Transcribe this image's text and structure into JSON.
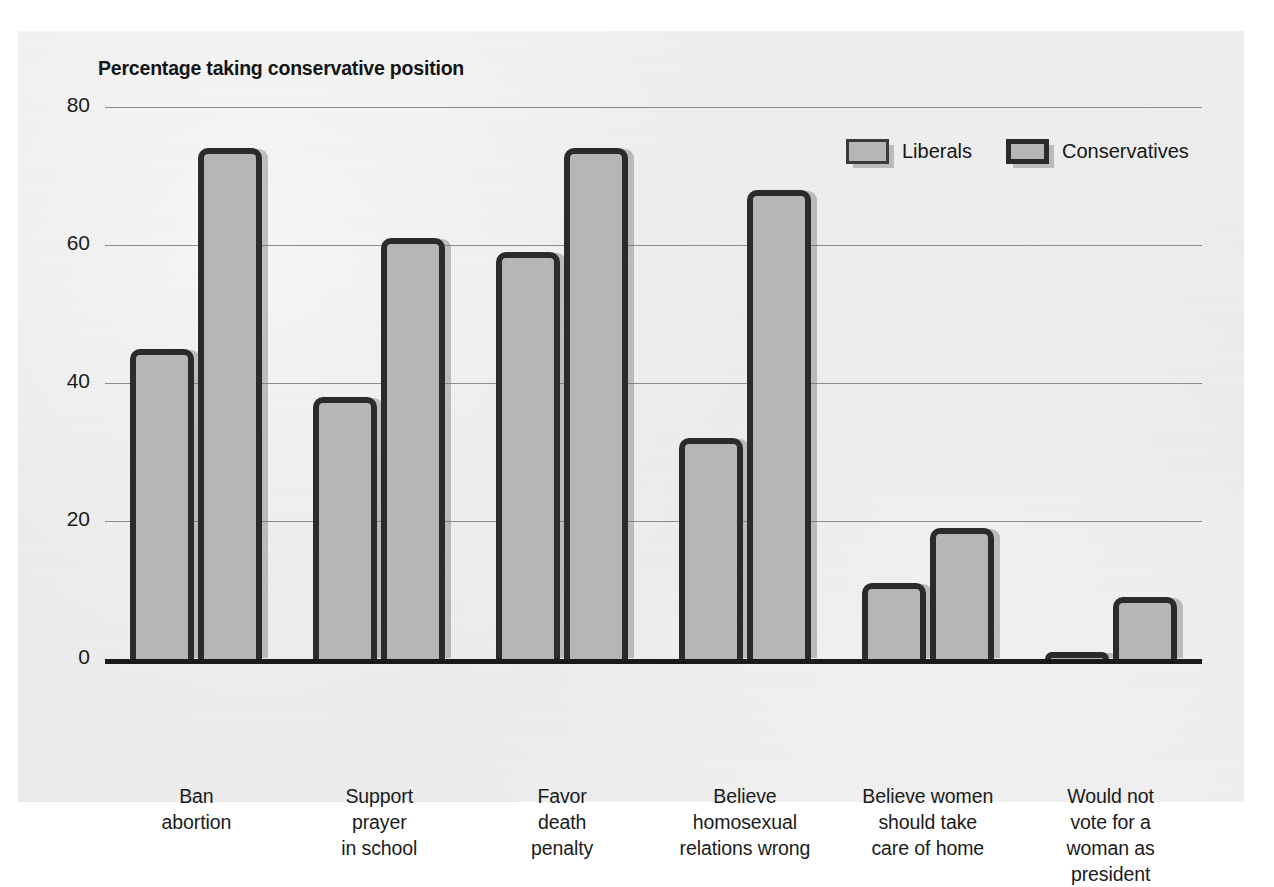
{
  "chart_data": {
    "type": "bar",
    "title": "Percentage taking conservative position",
    "xlabel": "",
    "ylabel": "",
    "ylim": [
      0,
      80
    ],
    "yticks": [
      0,
      20,
      40,
      60,
      80
    ],
    "grid": true,
    "legend_position": "top-right",
    "categories": [
      "Ban abortion",
      "Support prayer in school",
      "Favor death penalty",
      "Believe homosexual relations wrong",
      "Believe women should take care of home",
      "Would not vote for a woman as president"
    ],
    "category_lines": [
      [
        "Ban",
        "abortion"
      ],
      [
        "Support",
        "prayer",
        "in school"
      ],
      [
        "Favor",
        "death",
        "penalty"
      ],
      [
        "Believe",
        "homosexual",
        "relations wrong"
      ],
      [
        "Believe women",
        "should take",
        "care of home"
      ],
      [
        "Would not",
        "vote for a",
        "woman as",
        "president"
      ]
    ],
    "series": [
      {
        "name": "Liberals",
        "values": [
          45,
          38,
          59,
          32,
          11,
          1
        ]
      },
      {
        "name": "Conservatives",
        "values": [
          74,
          61,
          74,
          68,
          19,
          9
        ]
      }
    ],
    "colors": {
      "bar_fill": "#b6b6b6",
      "bar_outline": "#2b2b2b",
      "gridline": "#8d8d8d",
      "axis": "#1a1a1a",
      "panel_background": "#ececec",
      "text": "#1b1b1b"
    }
  },
  "legend": {
    "items": [
      {
        "label": "Liberals"
      },
      {
        "label": "Conservatives"
      }
    ]
  }
}
